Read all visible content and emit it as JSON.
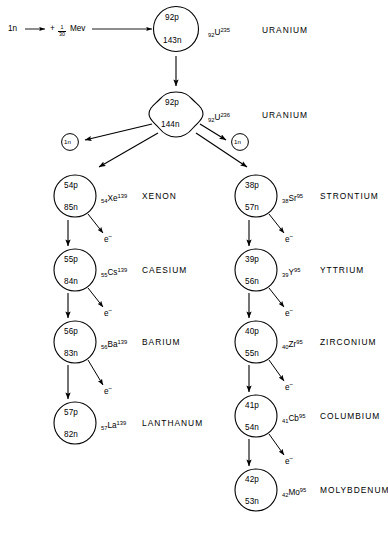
{
  "diagram": {
    "stroke_color": "#000000",
    "background_color": "#ffffff"
  },
  "reaction": {
    "neutron_in": "1n",
    "plus": "+",
    "energy_numerator": "1",
    "energy_denominator": "30",
    "energy_unit": "Mev"
  },
  "nuclei": {
    "u235": {
      "protons": "92p",
      "neutrons": "143n",
      "isotope_z": "92",
      "isotope_symbol": "U",
      "isotope_a": "235",
      "element": "URANIUM"
    },
    "u236": {
      "protons": "92p",
      "neutrons": "144n",
      "isotope_z": "92",
      "isotope_symbol": "U",
      "isotope_a": "236",
      "element": "URANIUM"
    },
    "neutron_left": {
      "label": "1n"
    },
    "neutron_right": {
      "label": "1n"
    }
  },
  "left_chain": [
    {
      "protons": "54p",
      "neutrons": "85n",
      "isotope_z": "54",
      "isotope_symbol": "Xe",
      "isotope_a": "139",
      "element": "XENON",
      "decay_label": "e",
      "decay_sup": "−"
    },
    {
      "protons": "55p",
      "neutrons": "84n",
      "isotope_z": "55",
      "isotope_symbol": "Cs",
      "isotope_a": "139",
      "element": "CAESIUM",
      "decay_label": "e",
      "decay_sup": "−"
    },
    {
      "protons": "56p",
      "neutrons": "83n",
      "isotope_z": "56",
      "isotope_symbol": "Ba",
      "isotope_a": "139",
      "element": "BARIUM",
      "decay_label": "e",
      "decay_sup": "−"
    },
    {
      "protons": "57p",
      "neutrons": "82n",
      "isotope_z": "57",
      "isotope_symbol": "La",
      "isotope_a": "139",
      "element": "LANTHANUM",
      "decay_label": "",
      "decay_sup": ""
    }
  ],
  "right_chain": [
    {
      "protons": "38p",
      "neutrons": "57n",
      "isotope_z": "38",
      "isotope_symbol": "Sr",
      "isotope_a": "95",
      "element": "STRONTIUM",
      "decay_label": "e",
      "decay_sup": "−"
    },
    {
      "protons": "39p",
      "neutrons": "56n",
      "isotope_z": "39",
      "isotope_symbol": "Y",
      "isotope_a": "95",
      "element": "YTTRIUM",
      "decay_label": "e",
      "decay_sup": "−"
    },
    {
      "protons": "40p",
      "neutrons": "55n",
      "isotope_z": "40",
      "isotope_symbol": "Zr",
      "isotope_a": "95",
      "element": "ZIRCONIUM",
      "decay_label": "e",
      "decay_sup": "−"
    },
    {
      "protons": "41p",
      "neutrons": "54n",
      "isotope_z": "41",
      "isotope_symbol": "Cb",
      "isotope_a": "95",
      "element": "COLUMBIUM",
      "decay_label": "e",
      "decay_sup": "−"
    },
    {
      "protons": "42p",
      "neutrons": "53n",
      "isotope_z": "42",
      "isotope_symbol": "Mo",
      "isotope_a": "95",
      "element": "MOLYBDENUM",
      "decay_label": "",
      "decay_sup": ""
    }
  ]
}
